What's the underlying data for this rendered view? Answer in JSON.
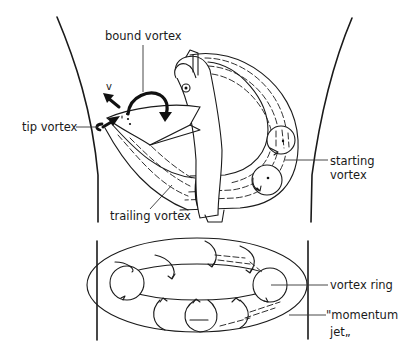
{
  "figure": {
    "colors": {
      "ink": "#1a1a1a",
      "background": "#ffffff"
    }
  },
  "labels": {
    "bound_vortex": "bound vortex",
    "velocity": "v",
    "tip_vortex": "tip vortex",
    "starting_vortex_line1": "starting",
    "starting_vortex_line2": "vortex",
    "trailing_vortex": "trailing vortex",
    "vortex_ring": "vortex ring",
    "momentum_jet_line1": "\"momentum",
    "momentum_jet_line2": "jet„"
  }
}
